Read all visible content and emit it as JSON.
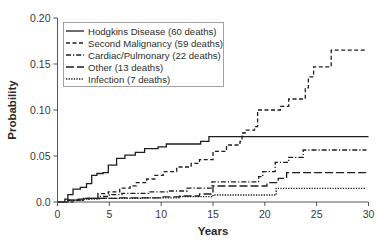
{
  "chart_data": {
    "type": "line",
    "subtype": "step / cumulative incidence",
    "title": "",
    "xlabel": "Years",
    "ylabel": "Probability",
    "xlim": [
      0,
      30
    ],
    "ylim": [
      0,
      0.2
    ],
    "x_ticks": [
      0,
      5,
      10,
      15,
      20,
      25,
      30
    ],
    "x_tick_labels": [
      "0",
      "5",
      "10",
      "15",
      "20",
      "25",
      "30"
    ],
    "y_ticks": [
      0,
      0.05,
      0.1,
      0.15,
      0.2
    ],
    "y_tick_labels": [
      "0.0",
      "0.05",
      "0.10",
      "0.15",
      "0.20"
    ],
    "grid": false,
    "legend_position": "upper left",
    "series": [
      {
        "name": "Hodgkins Disease (60 deaths)",
        "style": "solid",
        "points": [
          [
            0,
            0
          ],
          [
            0.7,
            0.003
          ],
          [
            1.0,
            0.008
          ],
          [
            1.5,
            0.014
          ],
          [
            2.2,
            0.016
          ],
          [
            2.8,
            0.02
          ],
          [
            3.3,
            0.029
          ],
          [
            3.8,
            0.031
          ],
          [
            4.4,
            0.032
          ],
          [
            4.9,
            0.04
          ],
          [
            5.7,
            0.0475
          ],
          [
            6.5,
            0.051
          ],
          [
            7.5,
            0.054
          ],
          [
            8.4,
            0.058
          ],
          [
            9.7,
            0.06
          ],
          [
            10.5,
            0.063
          ],
          [
            13.8,
            0.066
          ],
          [
            14.6,
            0.071
          ],
          [
            30,
            0.071
          ]
        ]
      },
      {
        "name": "Second Malignancy (59 deaths)",
        "style": "dashed",
        "points": [
          [
            0,
            0
          ],
          [
            1.5,
            0.002
          ],
          [
            2.5,
            0.004
          ],
          [
            3.9,
            0.009
          ],
          [
            4.9,
            0.011
          ],
          [
            6.0,
            0.015
          ],
          [
            7.0,
            0.0175
          ],
          [
            7.6,
            0.021
          ],
          [
            8.6,
            0.025
          ],
          [
            9.4,
            0.029
          ],
          [
            10.2,
            0.033
          ],
          [
            11.5,
            0.038
          ],
          [
            12.9,
            0.042
          ],
          [
            13.7,
            0.046
          ],
          [
            15.0,
            0.055
          ],
          [
            16.3,
            0.062
          ],
          [
            17.6,
            0.066
          ],
          [
            17.8,
            0.075
          ],
          [
            18.1,
            0.078
          ],
          [
            19.0,
            0.082
          ],
          [
            19.3,
            0.1
          ],
          [
            21.5,
            0.104
          ],
          [
            22.3,
            0.112
          ],
          [
            23.9,
            0.124
          ],
          [
            24.2,
            0.136
          ],
          [
            24.7,
            0.147
          ],
          [
            26.4,
            0.165
          ],
          [
            29.8,
            0.165
          ]
        ]
      },
      {
        "name": "Cardiac/Pulmonary (22 deaths)",
        "style": "dash-dot",
        "points": [
          [
            0,
            0
          ],
          [
            1.0,
            0.002
          ],
          [
            2.5,
            0.004
          ],
          [
            3.9,
            0.006
          ],
          [
            5.0,
            0.008
          ],
          [
            6.2,
            0.0095
          ],
          [
            8.8,
            0.011
          ],
          [
            10.7,
            0.012
          ],
          [
            12.5,
            0.015
          ],
          [
            14.9,
            0.022
          ],
          [
            19.4,
            0.0275
          ],
          [
            19.8,
            0.033
          ],
          [
            21.0,
            0.043
          ],
          [
            22.3,
            0.0486
          ],
          [
            23.7,
            0.0565
          ],
          [
            29.8,
            0.0565
          ]
        ]
      },
      {
        "name": "Other (13 deaths)",
        "style": "long-dash",
        "points": [
          [
            0,
            0
          ],
          [
            1.0,
            0.002
          ],
          [
            2.0,
            0.003
          ],
          [
            3.0,
            0.004
          ],
          [
            6.0,
            0.0045
          ],
          [
            10.0,
            0.0055
          ],
          [
            11.8,
            0.0065
          ],
          [
            13.7,
            0.0087
          ],
          [
            15.0,
            0.0174
          ],
          [
            20.2,
            0.021
          ],
          [
            21.3,
            0.0257
          ],
          [
            22.1,
            0.032
          ],
          [
            29.8,
            0.032
          ]
        ]
      },
      {
        "name": "Infection (7 deaths)",
        "style": "dotted",
        "points": [
          [
            0,
            0
          ],
          [
            1.0,
            0.002
          ],
          [
            2.5,
            0.003
          ],
          [
            4.0,
            0.004
          ],
          [
            8.0,
            0.0045
          ],
          [
            11.8,
            0.0058
          ],
          [
            15.0,
            0.0076
          ],
          [
            21.1,
            0.0149
          ],
          [
            29.8,
            0.0149
          ]
        ]
      }
    ]
  },
  "legend": {
    "items": [
      {
        "label": "Hodgkins Disease (60 deaths)",
        "style": "solid"
      },
      {
        "label": "Second Malignancy (59 deaths)",
        "style": "dashed"
      },
      {
        "label": "Cardiac/Pulmonary (22 deaths)",
        "style": "dash-dot"
      },
      {
        "label": "Other (13 deaths)",
        "style": "long-dash"
      },
      {
        "label": "Infection (7 deaths)",
        "style": "dotted"
      }
    ]
  },
  "colors": {
    "line": "#1e1e1e",
    "axis": "#555555",
    "legend_border": "#8a8a8a",
    "background": "#ffffff"
  }
}
